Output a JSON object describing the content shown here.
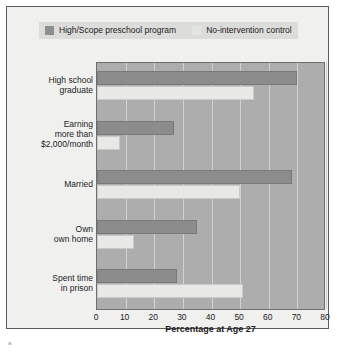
{
  "legend": {
    "items": [
      {
        "label": "High/Scope preschool program",
        "swatch": "dark",
        "color": "#8c8c8c"
      },
      {
        "label": "No-intervention control",
        "swatch": "light",
        "color": "#e8e8e6"
      }
    ]
  },
  "chart_data": {
    "type": "bar",
    "orientation": "horizontal",
    "title": "",
    "xlabel": "Percentage at Age 27",
    "ylabel": "",
    "xlim": [
      0,
      80
    ],
    "xticks": [
      0,
      10,
      20,
      30,
      40,
      50,
      60,
      70,
      80
    ],
    "grid": true,
    "legend_position": "top",
    "categories": [
      "High school graduate",
      "Earning more than $2,000/month",
      "Married",
      "Own own home",
      "Spent time in prison"
    ],
    "category_lines": [
      [
        "High school",
        "graduate"
      ],
      [
        "Earning",
        "more than",
        "$2,000/month"
      ],
      [
        "Married"
      ],
      [
        "Own",
        "own home"
      ],
      [
        "Spent time",
        "in prison"
      ]
    ],
    "series": [
      {
        "name": "High/Scope preschool program",
        "color": "#8c8c8c",
        "values": [
          70,
          27,
          68,
          35,
          28
        ]
      },
      {
        "name": "No-intervention control",
        "color": "#e8e8e6",
        "values": [
          55,
          8,
          50,
          13,
          51
        ]
      }
    ]
  },
  "axis": {
    "x_title": "Percentage at Age 27",
    "tick_labels": [
      "0",
      "10",
      "20",
      "30",
      "40",
      "50",
      "60",
      "70",
      "80"
    ]
  },
  "footer": {
    "mark": "a"
  }
}
